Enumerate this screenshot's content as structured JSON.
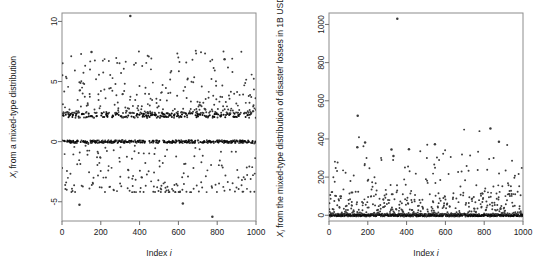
{
  "figure": {
    "background": "#ffffff",
    "point_color": "#3b3b3b",
    "dense_color": "#0d0d0d",
    "frame_color": "#8c8c8c",
    "panels": 2
  },
  "chart_data": [
    {
      "id": "left",
      "type": "scatter",
      "title": "",
      "xlabel": "Index i",
      "ylabel": "X_i from a mixed-type distribution",
      "ylabel_display": "X",
      "ylabel_sub": "i",
      "ylabel_rest": " from a mixed-type distribution",
      "xlabel_display": "Index ",
      "xlabel_italic": "i",
      "xlim": [
        0,
        1000
      ],
      "ylim": [
        -6.6,
        10.7
      ],
      "xticks": [
        0,
        200,
        400,
        600,
        800,
        1000
      ],
      "yticks": [
        -5,
        0,
        5,
        10
      ],
      "xtick_labels": [
        "0",
        "200",
        "400",
        "600",
        "800",
        "1000"
      ],
      "ytick_labels": [
        "-5",
        "0",
        "5",
        "10"
      ],
      "grid": false,
      "legend": "none",
      "n_points": 1000,
      "description": "Mixed-type distribution: a point mass band at 0, a dense band near 2.2, a diffuse upper cloud 2.5-7.5 and a diffuse lower cloud -0.2 to -4",
      "components": [
        {
          "name": "atom-at-zero",
          "value": 0.0,
          "fraction": 0.33,
          "jitter": 0.12
        },
        {
          "name": "atom-near-two",
          "value": 2.2,
          "fraction": 0.22,
          "jitter": 0.22
        },
        {
          "name": "upper-continuous",
          "range": [
            2.4,
            7.6
          ],
          "fraction": 0.26
        },
        {
          "name": "lower-continuous",
          "range": [
            -4.2,
            -0.1
          ],
          "fraction": 0.19
        }
      ],
      "outliers": [
        {
          "index": 352,
          "value": 10.45
        },
        {
          "index": 90,
          "value": -5.25
        },
        {
          "index": 623,
          "value": -5.15
        },
        {
          "index": 775,
          "value": -6.25
        },
        {
          "index": 152,
          "value": 7.45
        },
        {
          "index": 838,
          "value": 6.85
        }
      ]
    },
    {
      "id": "right",
      "type": "scatter",
      "title": "",
      "xlabel": "Index i",
      "ylabel": "X_i from the mixed-type distribution of disaster losses in 1B USD",
      "ylabel_display": "X",
      "ylabel_sub": "i",
      "ylabel_rest": " from the mixed-type distribution of disaster losses in 1B USD",
      "xlabel_display": "Index ",
      "xlabel_italic": "i",
      "xlim": [
        0,
        1000
      ],
      "ylim": [
        -30,
        1060
      ],
      "xticks": [
        0,
        200,
        400,
        600,
        800,
        1000
      ],
      "yticks": [
        0,
        200,
        400,
        600,
        800,
        1000
      ],
      "xtick_labels": [
        "0",
        "200",
        "400",
        "600",
        "800",
        "1000"
      ],
      "ytick_labels": [
        "0",
        "200",
        "400",
        "600",
        "800",
        "1000"
      ],
      "grid": false,
      "legend": "none",
      "n_points": 1000,
      "description": "Heavy-tailed disaster losses: a dense point mass band at ~0 with a decaying cloud of losses up to ~300 and rare extremes above 400",
      "components": [
        {
          "name": "atom-at-zero",
          "value": 0,
          "fraction": 0.55,
          "jitter": 6
        },
        {
          "name": "small-losses",
          "range": [
            5,
            110
          ],
          "fraction": 0.33
        },
        {
          "name": "moderate-losses",
          "range": [
            110,
            300
          ],
          "fraction": 0.1
        },
        {
          "name": "large-losses",
          "range": [
            300,
            460
          ],
          "fraction": 0.02
        }
      ],
      "outliers": [
        {
          "index": 352,
          "value": 1030
        },
        {
          "index": 148,
          "value": 522
        },
        {
          "index": 832,
          "value": 455
        },
        {
          "index": 186,
          "value": 382
        },
        {
          "index": 876,
          "value": 385
        },
        {
          "index": 546,
          "value": 372
        },
        {
          "index": 146,
          "value": 357
        },
        {
          "index": 322,
          "value": 345
        },
        {
          "index": 412,
          "value": 346
        },
        {
          "index": 332,
          "value": 310
        }
      ]
    }
  ]
}
